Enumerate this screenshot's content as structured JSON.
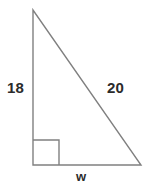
{
  "figure": {
    "type": "right-triangle-diagram",
    "background_color": "#ffffff",
    "stroke_color": "#808080",
    "text_color": "#2b2b2b",
    "vertices": {
      "apex": [
        33,
        10
      ],
      "right_angle": [
        33,
        165
      ],
      "base_right": [
        141,
        165
      ]
    },
    "right_angle_marker": {
      "x": 33,
      "y": 140,
      "width": 26,
      "height": 25
    },
    "labels": {
      "vertical_leg": "18",
      "hypotenuse": "20",
      "base": "w"
    }
  }
}
